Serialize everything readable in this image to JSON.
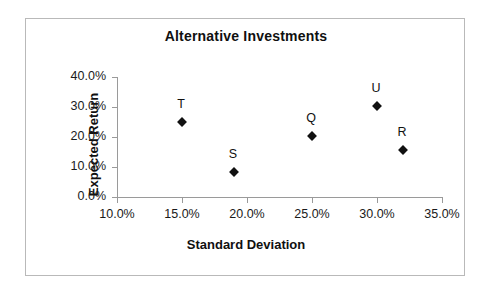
{
  "chart_data": {
    "type": "scatter",
    "title": "Alternative Investments",
    "xlabel": "Standard Deviation",
    "ylabel": "Expected Return",
    "xlim": [
      10,
      35
    ],
    "ylim": [
      0,
      40
    ],
    "grid": false,
    "legend": "none",
    "marker": "diamond",
    "marker_color": "#111111",
    "x_tick_labels": [
      "10.0%",
      "15.0%",
      "20.0%",
      "25.0%",
      "30.0%",
      "35.0%"
    ],
    "x_tick_values": [
      10,
      15,
      20,
      25,
      30,
      35
    ],
    "y_tick_labels": [
      "0.0%",
      "10.0%",
      "20.0%",
      "30.0%",
      "40.0%"
    ],
    "y_tick_values": [
      0,
      10,
      20,
      30,
      40
    ],
    "points": [
      {
        "label": "T",
        "x": 15.0,
        "y": 25.0
      },
      {
        "label": "S",
        "x": 19.0,
        "y": 8.5
      },
      {
        "label": "Q",
        "x": 25.0,
        "y": 20.5
      },
      {
        "label": "U",
        "x": 30.0,
        "y": 30.5
      },
      {
        "label": "R",
        "x": 32.0,
        "y": 15.8
      }
    ]
  }
}
